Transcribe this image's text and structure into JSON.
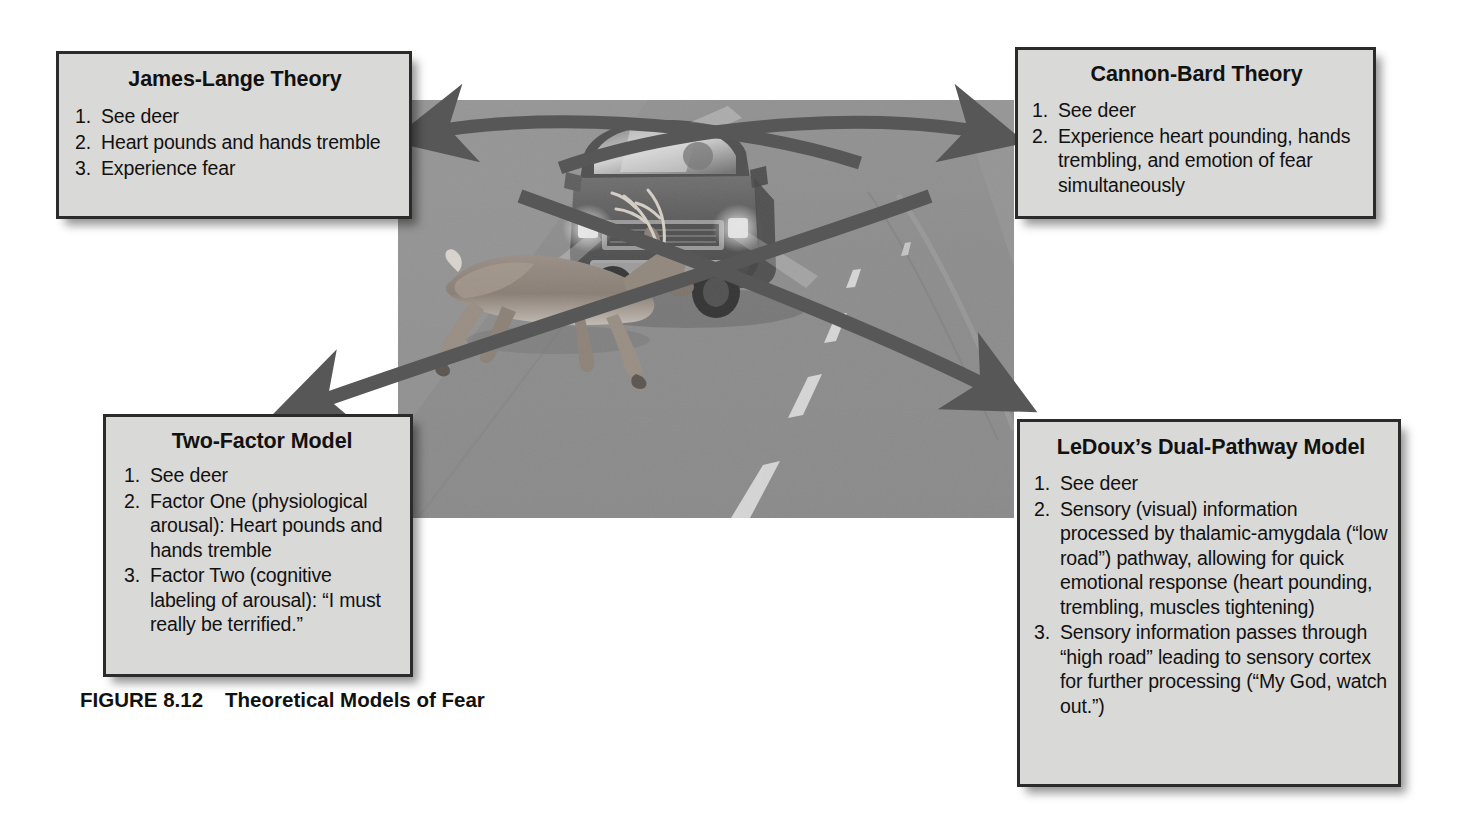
{
  "figure": {
    "caption_label": "FIGURE 8.12",
    "caption_title": "Theoretical Models of Fear",
    "scene_description": "Deer leaping in front of an oncoming pickup truck on a road",
    "colors": {
      "box_fill": "#d9d9d7",
      "box_border": "#2b2b2b",
      "arrow": "#575757",
      "road": "#8b8b8b",
      "text": "#111111"
    }
  },
  "boxes": [
    {
      "id": "james-lange",
      "title": "James-Lange Theory",
      "items": [
        {
          "num": "1.",
          "text": "See deer"
        },
        {
          "num": "2.",
          "text": "Heart pounds and hands tremble"
        },
        {
          "num": "3.",
          "text": "Experience fear"
        }
      ]
    },
    {
      "id": "cannon-bard",
      "title": "Cannon-Bard Theory",
      "items": [
        {
          "num": "1.",
          "text": "See deer"
        },
        {
          "num": "2.",
          "text": "Experience heart pounding, hands trembling, and emotion of fear simultaneously"
        }
      ]
    },
    {
      "id": "two-factor",
      "title": "Two-Factor Model",
      "items": [
        {
          "num": "1.",
          "text": "See deer"
        },
        {
          "num": "2.",
          "text": "Factor One (physiological arousal): Heart pounds and hands tremble"
        },
        {
          "num": "3.",
          "text": "Factor Two (cognitive labeling of arousal): “I must really be terrified.”"
        }
      ]
    },
    {
      "id": "ledoux",
      "title": "LeDoux’s Dual-Pathway Model",
      "items": [
        {
          "num": "1.",
          "text": "See deer"
        },
        {
          "num": "2.",
          "text": "Sensory (visual) information processed by thalamic-amygdala (“low road”) pathway, allowing for quick emotional response (heart pounding, trembling, muscles tightening)"
        },
        {
          "num": "3.",
          "text": "Sensory information passes through “high road” leading to sensory cortex for further processing (“My God, watch out.”)"
        }
      ]
    }
  ],
  "arrows": [
    {
      "id": "arrow-to-james-lange",
      "target": "James-Lange Theory",
      "direction": "up-left"
    },
    {
      "id": "arrow-to-cannon-bard",
      "target": "Cannon-Bard Theory",
      "direction": "up-right"
    },
    {
      "id": "arrow-to-two-factor",
      "target": "Two-Factor Model",
      "direction": "down-left"
    },
    {
      "id": "arrow-to-ledoux",
      "target": "LeDoux’s Dual-Pathway Model",
      "direction": "down-right"
    }
  ]
}
